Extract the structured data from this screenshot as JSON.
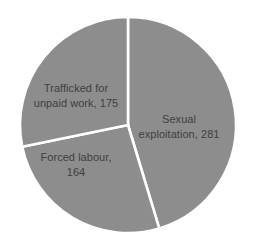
{
  "chart_data": {
    "type": "pie",
    "title": "",
    "subtitle": "",
    "xlabel": "",
    "ylabel": "",
    "legend": "none",
    "grid": false,
    "total": 620,
    "start_angle_deg": 0,
    "direction": "clockwise",
    "categories": [
      "Sexual exploitation",
      "Forced labour",
      "Trafficked for unpaid work"
    ],
    "values": [
      281,
      164,
      175
    ],
    "slices": [
      {
        "name": "Sexual exploitation",
        "value": 281,
        "label_lines": [
          "Sexual",
          "exploitation, 281"
        ],
        "percent": 45.3,
        "start_deg": 0,
        "end_deg": 163.2,
        "color": "#8d8d8d",
        "label_x": 179,
        "label_y": 126
      },
      {
        "name": "Forced labour",
        "value": 164,
        "label_lines": [
          "Forced labour,",
          "164"
        ],
        "percent": 26.5,
        "start_deg": 163.2,
        "end_deg": 258.4,
        "color": "#8d8d8d",
        "label_x": 76,
        "label_y": 164
      },
      {
        "name": "Trafficked for unpaid work",
        "value": 175,
        "label_lines": [
          "Trafficked for",
          "unpaid work, 175"
        ],
        "percent": 28.2,
        "start_deg": 258.4,
        "end_deg": 360,
        "color": "#8d8d8d",
        "label_x": 76,
        "label_y": 95
      }
    ],
    "geometry": {
      "center_x": 128,
      "center_y": 125,
      "radius": 108
    },
    "style": {
      "slice_color": "#8d8d8d",
      "separator_color": "#ffffff",
      "separator_width": 2.6,
      "label_color": "#404040",
      "background": "#ffffff"
    }
  }
}
